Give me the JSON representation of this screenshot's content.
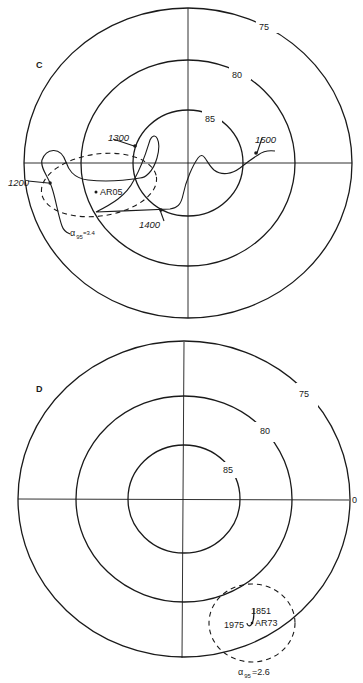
{
  "panel_c": {
    "label": "C",
    "ring_labels": {
      "r75": "75",
      "r80": "80",
      "r85": "85"
    },
    "date_labels": {
      "d1200": "1200",
      "d1300": "1300",
      "d1400": "1400",
      "d1500": "1500"
    },
    "site": "AR05",
    "alpha95_symbol": "α",
    "alpha95_sub": "95",
    "alpha95_value": "=3.4"
  },
  "panel_d": {
    "label": "D",
    "ring_labels": {
      "r75": "75",
      "r80": "80",
      "r85": "85"
    },
    "longitude_label": "0",
    "date_labels": {
      "d1851": "1851",
      "d1975": "1975"
    },
    "site": "AR73",
    "alpha95_symbol": "α",
    "alpha95_sub": "95",
    "alpha95_value": "=2.6"
  },
  "colors": {
    "ink": "#1a1a1a",
    "background": "#ffffff"
  }
}
